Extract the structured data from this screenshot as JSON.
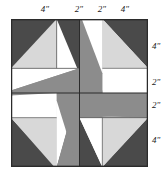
{
  "diagram": {
    "kind": "quilt-block-pinwheel-diagram",
    "title": "",
    "block": {
      "total_width_inches": 12,
      "total_height_inches": 12,
      "grid_divisions_inches": [
        4,
        2,
        2,
        4
      ]
    },
    "top_labels": [
      {
        "text": "4\"",
        "segment_inches": 4
      },
      {
        "text": "2\"",
        "segment_inches": 2
      },
      {
        "text": "2\"",
        "segment_inches": 2
      },
      {
        "text": "4\"",
        "segment_inches": 4
      }
    ],
    "right_labels": [
      {
        "text": "4\"",
        "segment_inches": 4
      },
      {
        "text": "2\"",
        "segment_inches": 2
      },
      {
        "text": "2\"",
        "segment_inches": 2
      },
      {
        "text": "4\"",
        "segment_inches": 4
      }
    ],
    "colors": {
      "dark_gray": "#4a4a4a",
      "medium_gray": "#8c8c8c",
      "light_gray": "#d8d8d8",
      "white": "#ffffff",
      "outline": "#2b2b2b",
      "inner_line": "#555555",
      "text": "#1a1a1a"
    },
    "fabric_legend": [
      {
        "name": "dark fabric",
        "color": "#4a4a4a"
      },
      {
        "name": "medium fabric",
        "color": "#8c8c8c"
      },
      {
        "name": "light fabric",
        "color": "#d8d8d8"
      },
      {
        "name": "background fabric",
        "color": "#ffffff"
      }
    ]
  }
}
